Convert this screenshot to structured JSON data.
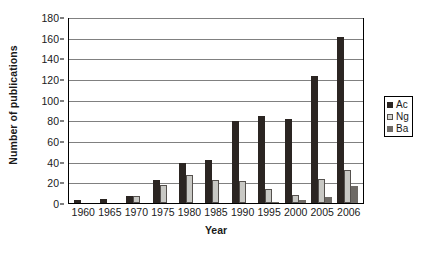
{
  "chart_data": {
    "type": "bar",
    "title": "",
    "xlabel": "Year",
    "ylabel": "Number of publications",
    "categories": [
      "1960",
      "1965",
      "1970",
      "1975",
      "1980",
      "1985",
      "1990",
      "1995",
      "2000",
      "2005",
      "2006"
    ],
    "series": [
      {
        "name": "Ac",
        "color": "#2b2522",
        "values": [
          3,
          4,
          7,
          22,
          39,
          42,
          79,
          84,
          81,
          123,
          161
        ]
      },
      {
        "name": "Ng",
        "color": "#c8c8c4",
        "values": [
          0,
          0,
          7,
          17,
          27,
          22,
          21,
          14,
          8,
          23,
          32
        ]
      },
      {
        "name": "Ba",
        "color": "#6e6a66",
        "values": [
          0,
          0,
          0,
          0,
          0,
          0,
          0,
          1,
          3,
          6,
          16
        ]
      }
    ],
    "ylim": [
      0,
      180
    ],
    "ytick_step": 20,
    "yticks": [
      0,
      20,
      40,
      60,
      80,
      100,
      120,
      140,
      160,
      180
    ],
    "grid": "horizontal",
    "legend_position": "right"
  }
}
